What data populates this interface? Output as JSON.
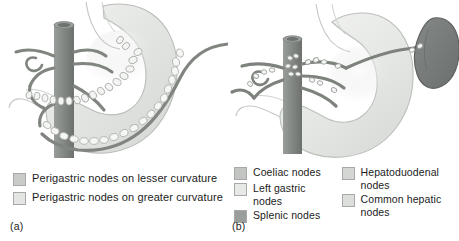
{
  "figure": {
    "colors": {
      "stomach_fill": "#e9ebe8",
      "stomach_edge": "#b9bdb8",
      "vessel": "#8a8f8c",
      "vessel_dark": "#6f7572",
      "aorta": "#8c908d",
      "aorta_dark": "#747875",
      "spleen": "#7a7e7c",
      "spleen_edge": "#5e625f",
      "node_fill": "#f4f5f3",
      "node_edge": "#a9aeab",
      "background": "#ffffff",
      "text": "#1c1c1c"
    }
  },
  "panel_a": {
    "caption": "(a)",
    "legend": [
      {
        "label": "Perigastric nodes on lesser curvature",
        "swatch": "#c9cbc8",
        "name": "lesser-curvature"
      },
      {
        "label": "Perigastric nodes on greater curvature",
        "swatch": "#e4e6e3",
        "name": "greater-curvature"
      }
    ]
  },
  "panel_b": {
    "caption": "(b)",
    "legend_left": [
      {
        "label": "Coeliac nodes",
        "swatch": "#c2c5c2",
        "name": "coeliac"
      },
      {
        "label": "Left gastric nodes",
        "swatch": "#e7e9e6",
        "name": "left-gastric"
      },
      {
        "label": "Splenic nodes",
        "swatch": "#9a9e9b",
        "name": "splenic"
      }
    ],
    "legend_right": [
      {
        "label": "Hepatoduodenal\nnodes",
        "swatch": "#d3d6d3",
        "name": "hepatoduodenal"
      },
      {
        "label": "Common hepatic\nnodes",
        "swatch": "#dcdedb",
        "name": "common-hepatic"
      }
    ]
  }
}
